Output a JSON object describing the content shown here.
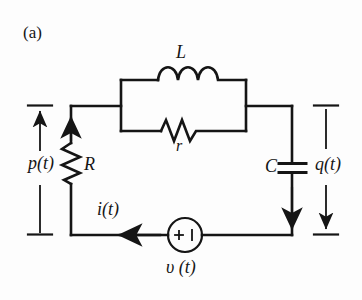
{
  "figure": {
    "panel_label": "(a)",
    "kind": "circuit-diagram",
    "ink_color": "#151515",
    "background_color": "#fdfdfd"
  },
  "components": {
    "inductor": {
      "symbol": "L",
      "name": "inductor",
      "coil_loops": 3,
      "position": "top-branch-of-parallel-block"
    },
    "coil_resistor": {
      "symbol": "r",
      "name": "coil-series-resistance",
      "zigzag_peaks": 3,
      "position": "bottom-branch-of-parallel-block"
    },
    "resistor": {
      "symbol": "R",
      "name": "resistor",
      "zigzag_peaks": 4,
      "position": "left-branch"
    },
    "capacitor": {
      "symbol": "C",
      "name": "capacitor",
      "plates": 2,
      "position": "right-branch"
    },
    "source": {
      "symbol": "υ (t)",
      "name": "voltage-source",
      "plus_sign": "+",
      "minus_sign": "❘",
      "position": "bottom-branch"
    }
  },
  "variables": {
    "flux_linkage": "p(t)",
    "charge": "q(t)",
    "current": "i(t)",
    "voltage": "υ (t)"
  },
  "arrows": {
    "p_direction": "up",
    "q_direction": "down",
    "i_direction": "left",
    "branch_current_left": "up",
    "branch_current_right": "down"
  }
}
